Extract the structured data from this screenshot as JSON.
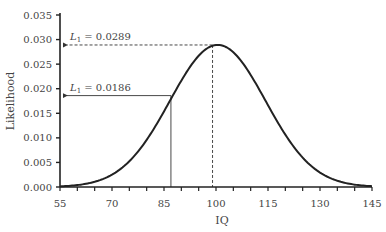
{
  "chart_data": {
    "type": "line",
    "title": "",
    "xlabel": "IQ",
    "ylabel": "Likelihood",
    "xlim": [
      55,
      145
    ],
    "ylim": [
      0,
      0.035
    ],
    "x_ticks": [
      55,
      70,
      85,
      100,
      115,
      130,
      145
    ],
    "x_tick_labels": [
      "55",
      "70",
      "85",
      "100",
      "115",
      "130",
      "145"
    ],
    "x_minor_step": 5,
    "y_ticks": [
      0,
      0.005,
      0.01,
      0.015,
      0.02,
      0.025,
      0.03,
      0.035
    ],
    "y_tick_labels": [
      "0.000",
      "0.005",
      "0.010",
      "0.015",
      "0.020",
      "0.025",
      "0.030",
      "0.035"
    ],
    "grid": false,
    "series": [
      {
        "name": "Normal likelihood curve",
        "distribution": "normal",
        "mean": 100.5,
        "sd": 13.8
      }
    ],
    "annotations": [
      {
        "label_main": "L",
        "label_sub": "1",
        "label_value": " = 0.0289",
        "x": 99,
        "y": 0.0289,
        "style": "dashed"
      },
      {
        "label_main": "L",
        "label_sub": "1",
        "label_value": " = 0.0186",
        "x": 87,
        "y": 0.0186,
        "style": "solid"
      }
    ]
  }
}
